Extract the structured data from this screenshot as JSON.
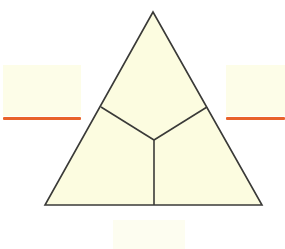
{
  "figure": {
    "background_color": "#ffffff",
    "shape": {
      "name": "equilateral-triangle",
      "fill_color": "#fcfce0",
      "stroke_color": "#3a3a38",
      "stroke_width": 1.6,
      "vertices": {
        "apex": [
          153,
          12
        ],
        "bottom_left": [
          45,
          205
        ],
        "bottom_right": [
          262,
          205
        ]
      }
    },
    "partition": {
      "name": "y-junction",
      "stroke_color": "#3a3a38",
      "stroke_width": 1.6,
      "center": [
        154,
        140
      ],
      "endpoints": {
        "left_edge_point": [
          101,
          107
        ],
        "right_edge_point": [
          207,
          107
        ],
        "base_point": [
          154,
          205
        ]
      },
      "region_count": 3
    }
  },
  "callouts": {
    "left": {
      "label": "",
      "box_color": "#fdfde8",
      "rule_color": "#e8622a"
    },
    "right": {
      "label": "",
      "box_color": "#fdfde8",
      "rule_color": "#e8622a"
    },
    "bottom": {
      "label": "",
      "box_color": "#fdfdf0"
    }
  }
}
